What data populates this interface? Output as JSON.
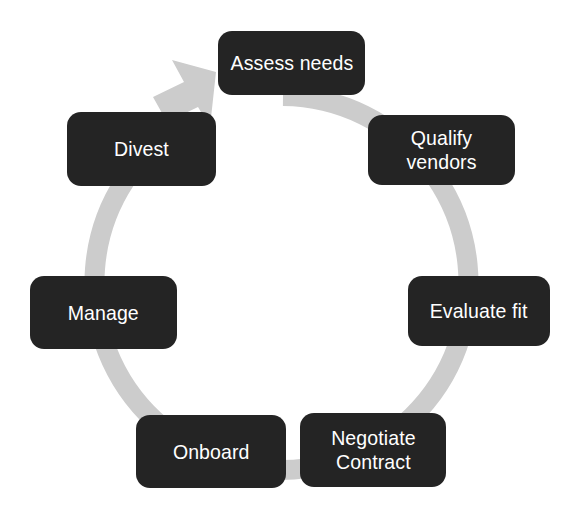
{
  "diagram": {
    "type": "cycle",
    "background_color": "#ffffff",
    "ring": {
      "color": "#cccccc",
      "thickness_px": 20,
      "center_x": 283,
      "center_y": 283,
      "radius": 187,
      "direction": "clockwise",
      "arrowhead": "points up-right toward the first stage"
    },
    "node_style": {
      "fill_color": "#242424",
      "text_color": "#ffffff",
      "corner_radius_px": 14
    },
    "stages": [
      {
        "id": "assess-needs",
        "label": "Assess needs",
        "order": 1,
        "angle_deg": 0,
        "clock_position": "12"
      },
      {
        "id": "qualify-vendors",
        "label": "Qualify vendors",
        "order": 2,
        "angle_deg": 51,
        "clock_position": "1-2"
      },
      {
        "id": "evaluate-fit",
        "label": "Evaluate fit",
        "order": 3,
        "angle_deg": 103,
        "clock_position": "3-4"
      },
      {
        "id": "negotiate-contract",
        "label": "Negotiate\nContract",
        "order": 4,
        "angle_deg": 154,
        "clock_position": "5"
      },
      {
        "id": "onboard",
        "label": "Onboard",
        "order": 5,
        "angle_deg": 206,
        "clock_position": "7"
      },
      {
        "id": "manage",
        "label": "Manage",
        "order": 6,
        "angle_deg": 257,
        "clock_position": "8-9"
      },
      {
        "id": "divest",
        "label": "Divest",
        "order": 7,
        "angle_deg": 309,
        "clock_position": "10-11"
      }
    ]
  }
}
